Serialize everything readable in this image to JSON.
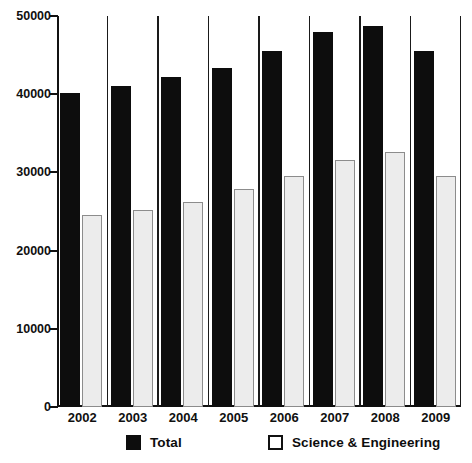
{
  "chart_data": {
    "type": "bar",
    "title": "",
    "subtitle": "",
    "xlabel": "",
    "ylabel": "",
    "categories": [
      "2002",
      "2003",
      "2004",
      "2005",
      "2006",
      "2007",
      "2008",
      "2009"
    ],
    "series": [
      {
        "name": "Total",
        "color": "#0d0d0d",
        "values": [
          40200,
          41000,
          42200,
          43400,
          45500,
          48000,
          48700,
          45500
        ]
      },
      {
        "name": "Science & Engineering",
        "color": "#ececec",
        "values": [
          24600,
          25200,
          26200,
          27900,
          29600,
          31600,
          32600,
          29500
        ]
      }
    ],
    "ylim": [
      0,
      50000
    ],
    "yticks": [
      0,
      10000,
      20000,
      30000,
      40000,
      50000
    ],
    "ytick_labels": [
      "0",
      "10000",
      "20000",
      "30000",
      "40000",
      "50000"
    ],
    "grid": false,
    "group_separators": true,
    "legend_position": "bottom"
  },
  "legend": {
    "items": [
      {
        "label": "Total",
        "swatch": "filled-black-square"
      },
      {
        "label": "Science & Engineering",
        "swatch": "outlined-white-square"
      }
    ]
  },
  "axis": {
    "y_tick_labels": [
      "50000",
      "40000",
      "30000",
      "20000",
      "10000",
      "0"
    ],
    "x_tick_labels": [
      "2002",
      "2003",
      "2004",
      "2005",
      "2006",
      "2007",
      "2008",
      "2009"
    ]
  },
  "colors": {
    "total_bar": "#0d0d0d",
    "se_bar_fill": "#ececec",
    "se_bar_stroke": "#8c8c8c",
    "axis": "#111111",
    "background": "#ffffff"
  }
}
